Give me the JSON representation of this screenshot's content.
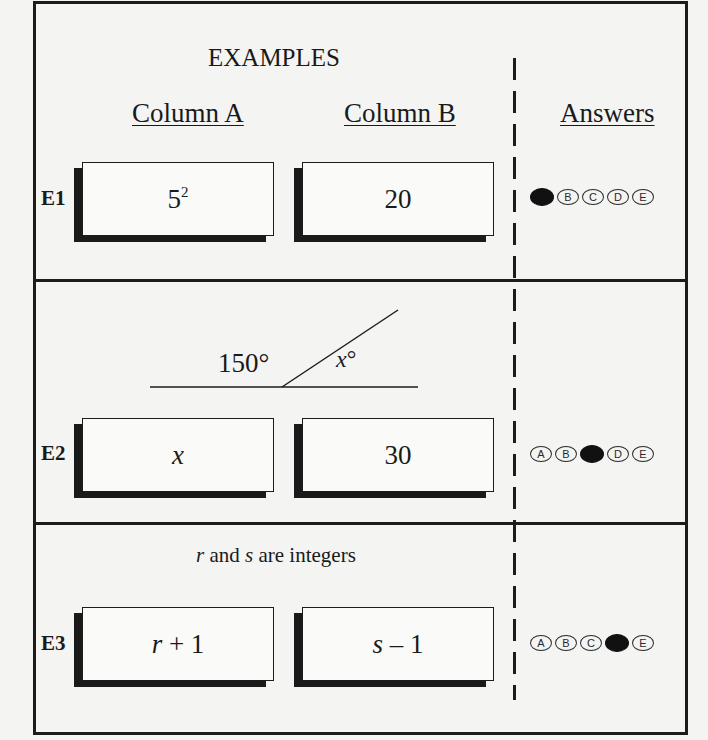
{
  "header": {
    "title": "EXAMPLES",
    "column_a": "Column A",
    "column_b": "Column B",
    "answers": "Answers"
  },
  "examples": [
    {
      "label": "E1",
      "column_a": {
        "base": "5",
        "exponent": "2"
      },
      "column_b": "20",
      "choices": [
        "A",
        "B",
        "C",
        "D",
        "E"
      ],
      "selected": "A"
    },
    {
      "label": "E2",
      "figure": {
        "type": "angle",
        "left_angle_label": "150°",
        "right_angle_var": "x",
        "right_angle_unit": "°"
      },
      "column_a": "x",
      "column_b": "30",
      "choices": [
        "A",
        "B",
        "C",
        "D",
        "E"
      ],
      "selected": "C"
    },
    {
      "label": "E3",
      "condition": {
        "var1": "r",
        "mid1": " and ",
        "var2": "s",
        "rest": " are integers"
      },
      "column_a": {
        "var": "r",
        "op": " + 1"
      },
      "column_b": {
        "var": "s",
        "op": " – 1"
      },
      "choices": [
        "A",
        "B",
        "C",
        "D",
        "E"
      ],
      "selected": "D"
    }
  ],
  "colors": {
    "ink": "#1c1c1c",
    "paper": "#f4f4f2",
    "filled_bubble": "#111111"
  }
}
